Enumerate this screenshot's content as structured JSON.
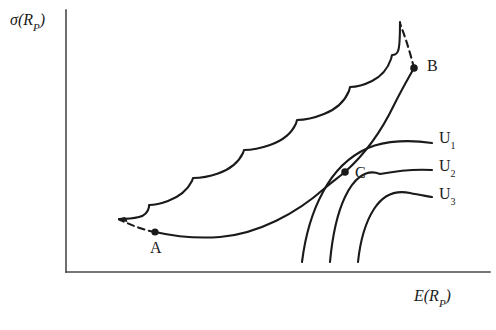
{
  "figure": {
    "type": "diagram",
    "background_color": "#ffffff",
    "stroke_color": "#1a1a1a"
  },
  "axes": {
    "y": {
      "label_main": "σ(R",
      "label_sub": "P",
      "label_close": ")",
      "label_full": "σ(R_P)",
      "x_px": 66,
      "top_px": 10,
      "bottom_px": 272
    },
    "x": {
      "label_main": "E(R",
      "label_sub": "P",
      "label_close": ")",
      "label_full": "E(R_P)",
      "y_px": 272,
      "left_px": 66,
      "right_px": 490
    }
  },
  "points": [
    {
      "name": "A",
      "label": "A",
      "x_px": 155,
      "y_px": 232,
      "role": "lower-left endpoint of efficient frontier"
    },
    {
      "name": "B",
      "label": "B",
      "x_px": 414,
      "y_px": 68,
      "role": "upper-right endpoint of efficient frontier"
    },
    {
      "name": "C",
      "label": "C",
      "x_px": 345,
      "y_px": 172,
      "role": "tangency point of frontier with indifference curve U2"
    }
  ],
  "curves": {
    "scalloped_boundary": {
      "name": "scalloped-upper-boundary",
      "description": "Upper boundary of the feasible set drawn as a series of concave scallop arcs rising from left to upper right",
      "scallop_count": 7,
      "start_px": [
        119,
        219
      ],
      "end_px": [
        400,
        22
      ]
    },
    "efficient_frontier": {
      "name": "efficient-frontier",
      "description": "Solid lower-right boundary running from A through C up to B",
      "from": "A",
      "through": "C",
      "to": "B"
    },
    "dashed_tail_A": {
      "name": "dashed-extension-A",
      "description": "Dashed arc extending up-left from point A to the start of the scalloped boundary",
      "from_px": [
        155,
        232
      ],
      "to_px": [
        118,
        219
      ]
    },
    "dashed_tail_B": {
      "name": "dashed-extension-B",
      "description": "Dashed arc extending up-left from point B to the peak of the scalloped boundary",
      "from_px": [
        414,
        68
      ],
      "to_px": [
        400,
        22
      ]
    },
    "indifference": [
      {
        "name": "U1",
        "label_main": "U",
        "label_sub": "1",
        "label_full": "U₁",
        "label_x_px": 439,
        "label_y_px": 130,
        "right_end_px": [
          432,
          143
        ],
        "bottom_end_px": [
          302,
          262
        ]
      },
      {
        "name": "U2",
        "label_main": "U",
        "label_sub": "2",
        "label_full": "U₂",
        "label_x_px": 439,
        "label_y_px": 158,
        "right_end_px": [
          432,
          170
        ],
        "bottom_end_px": [
          330,
          262
        ]
      },
      {
        "name": "U3",
        "label_main": "U",
        "label_sub": "3",
        "label_full": "U₃",
        "label_x_px": 439,
        "label_y_px": 186,
        "right_end_px": [
          432,
          197
        ],
        "bottom_end_px": [
          358,
          262
        ]
      }
    ]
  }
}
